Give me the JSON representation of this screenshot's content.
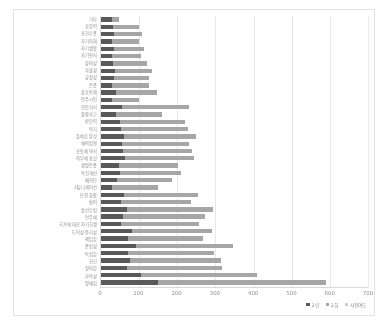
{
  "chart_data": {
    "type": "bar",
    "orientation": "horizontal",
    "stacked": true,
    "title": "",
    "xlabel": "",
    "ylabel": "",
    "xlim": [
      0,
      700
    ],
    "xticks": [
      0,
      100,
      200,
      300,
      400,
      500,
      600,
      700
    ],
    "grid": true,
    "legend_position": "bottom-right",
    "legend": [
      "2년",
      "2회",
      "사전여도"
    ],
    "categories": [
      "기타",
      "공감력",
      "표현수용",
      "자기이해",
      "자기생활",
      "자기인식",
      "창의성",
      "자율성",
      "긍정성",
      "존중",
      "상호반례",
      "민주시민",
      "전문지식",
      "융합사고",
      "판단력",
      "복지",
      "올바른 말섯",
      "예의범절",
      "공동체 의식",
      "직무에 충실",
      "생명존중",
      "복건개선",
      "배려단",
      "커뮤니케이션",
      "단결 화합",
      "협력",
      "솔선수범",
      "연우애",
      "국가에 대한 자기희생",
      "도덕성·윤리성",
      "책임감",
      "준법성",
      "독립감",
      "헌신",
      "정의감",
      "자복성",
      "명예심"
    ],
    "series": [
      {
        "name": "2년",
        "values": [
          28,
          32,
          35,
          30,
          34,
          30,
          32,
          36,
          34,
          30,
          40,
          28,
          55,
          40,
          50,
          52,
          60,
          55,
          58,
          62,
          48,
          50,
          42,
          30,
          60,
          52,
          68,
          58,
          52,
          80,
          72,
          92,
          70,
          75,
          68,
          105,
          150
        ]
      },
      {
        "name": "2회",
        "values": [
          18,
          68,
          72,
          70,
          78,
          76,
          88,
          98,
          92,
          96,
          106,
          72,
          175,
          120,
          170,
          175,
          190,
          175,
          180,
          182,
          155,
          160,
          145,
          120,
          195,
          185,
          225,
          215,
          205,
          210,
          195,
          255,
          225,
          240,
          250,
          305,
          440
        ]
      },
      {
        "name": "사전여도",
        "values": [
          0,
          0,
          0,
          0,
          0,
          0,
          0,
          0,
          0,
          0,
          0,
          0,
          0,
          0,
          0,
          0,
          0,
          0,
          0,
          0,
          0,
          0,
          0,
          0,
          0,
          0,
          0,
          0,
          0,
          0,
          0,
          0,
          0,
          0,
          0,
          0,
          0
        ]
      }
    ],
    "colors": {
      "series_1": "#595959",
      "series_2": "#a6a6a6",
      "series_3": "#d0d0d0",
      "gridline": "#e8e8e8",
      "axis": "#d9d9d9",
      "frame": "#e2e2e2",
      "tick_text": "#8f8f8f",
      "background": "#ffffff"
    }
  }
}
